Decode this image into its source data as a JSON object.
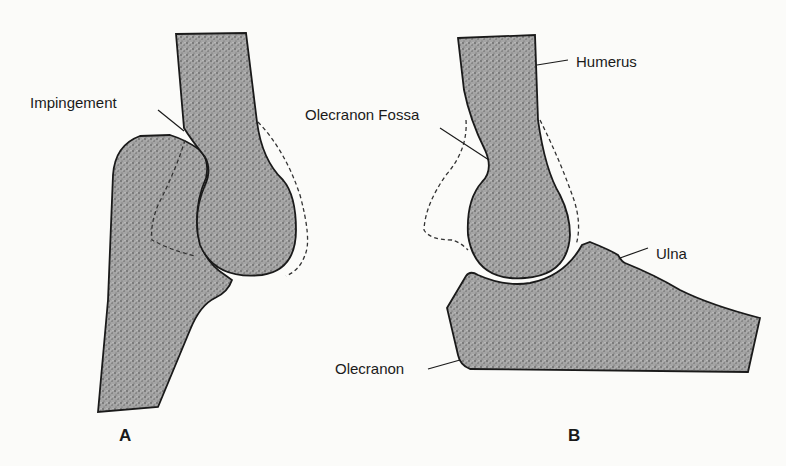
{
  "figure": {
    "panels": [
      {
        "id": "A",
        "label": "A",
        "annotations": [
          {
            "text": "Impingement"
          }
        ]
      },
      {
        "id": "B",
        "label": "B",
        "annotations": [
          {
            "text": "Humerus"
          },
          {
            "text": "Olecranon Fossa"
          },
          {
            "text": "Ulna"
          },
          {
            "text": "Olecranon"
          }
        ]
      }
    ],
    "colors": {
      "background": "#fbfbf9",
      "bone_fill": "#9a9a9a",
      "outline": "#1a1a1a"
    }
  }
}
